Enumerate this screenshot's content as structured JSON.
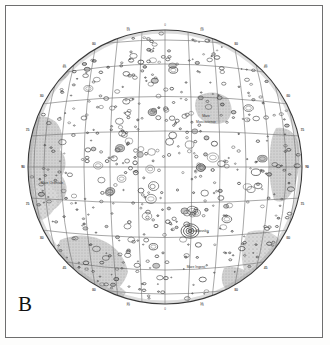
{
  "figure": {
    "panel_label": "B",
    "caption_text": "",
    "frame_color": "#6e6e6e",
    "background_color": "#ffffff",
    "ink_color": "#3a3a3a",
    "mare_fill_color": "#b9b9b9",
    "graticule_color": "#666666"
  },
  "map": {
    "type": "lunar-hemisphere-orthographic",
    "center_x": 165,
    "center_y": 167,
    "radius": 137,
    "graticule": {
      "latitude_step_deg": 15,
      "longitude_step_deg": 15,
      "latitude_ticks": [
        -75,
        -60,
        -45,
        -30,
        -15,
        0,
        15,
        30,
        45,
        60,
        75
      ],
      "longitude_ticks": [
        -90,
        -75,
        -60,
        -45,
        -30,
        -15,
        0,
        15,
        30,
        45,
        60,
        75,
        90
      ]
    },
    "tick_labels": [
      "90",
      "75",
      "60",
      "45",
      "30",
      "15",
      "0",
      "15",
      "30",
      "45",
      "60",
      "75",
      "90"
    ],
    "feature_labels": [
      {
        "text": "Mare",
        "x": 206,
        "y": 117
      },
      {
        "text": "Moscoviense",
        "x": 206,
        "y": 123
      },
      {
        "text": "Tsiolkovskiy",
        "x": 200,
        "y": 232
      },
      {
        "text": "Mare Ingenii",
        "x": 196,
        "y": 268
      },
      {
        "text": "Mare Orientale",
        "x": 52,
        "y": 184
      }
    ],
    "shaded_regions": [
      {
        "name": "western-limb-maria",
        "x": 40,
        "y": 170
      },
      {
        "name": "mare-moscoviense",
        "x": 213,
        "y": 110
      },
      {
        "name": "southwest-basin",
        "x": 100,
        "y": 272
      },
      {
        "name": "eastern-limb-maria",
        "x": 285,
        "y": 180
      },
      {
        "name": "southeast-limb-maria",
        "x": 252,
        "y": 262
      }
    ],
    "crater_count_approx": 520
  }
}
